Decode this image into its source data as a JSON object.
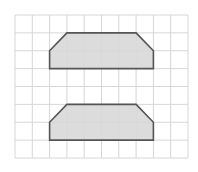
{
  "diagram": {
    "type": "grid-shapes",
    "grid": {
      "columns": 10,
      "rows": 8,
      "origin_px": [
        15,
        15
      ],
      "size_px": [
        173,
        143
      ],
      "line_color": "#d6d6d6"
    },
    "shapes": [
      {
        "name": "upper-hexagon",
        "points_grid": [
          [
            3,
            1
          ],
          [
            7,
            1
          ],
          [
            8,
            2
          ],
          [
            8,
            3
          ],
          [
            2,
            3
          ],
          [
            2,
            2
          ]
        ],
        "fill": "#d8d8d8",
        "stroke": "#555555"
      },
      {
        "name": "lower-hexagon",
        "points_grid": [
          [
            3,
            5
          ],
          [
            7,
            5
          ],
          [
            8,
            6
          ],
          [
            8,
            7
          ],
          [
            2,
            7
          ],
          [
            2,
            6
          ]
        ],
        "fill": "#d8d8d8",
        "stroke": "#555555"
      }
    ]
  }
}
